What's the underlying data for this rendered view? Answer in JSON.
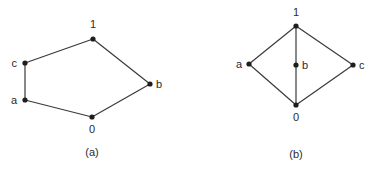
{
  "diagrams": [
    {
      "id": "a",
      "caption": "(a)",
      "caption_pos": [
        92,
        156
      ],
      "nodes": [
        {
          "name": "1",
          "x": 93,
          "y": 39,
          "lx": 93,
          "ly": 28,
          "anchor": "middle"
        },
        {
          "name": "c",
          "x": 25,
          "y": 63,
          "lx": 17,
          "ly": 67,
          "anchor": "end"
        },
        {
          "name": "a",
          "x": 25,
          "y": 100,
          "lx": 17,
          "ly": 104,
          "anchor": "end"
        },
        {
          "name": "0",
          "x": 92,
          "y": 117,
          "lx": 92,
          "ly": 133,
          "anchor": "middle"
        },
        {
          "name": "b",
          "x": 150,
          "y": 84,
          "lx": 156,
          "ly": 88,
          "anchor": "start"
        }
      ],
      "edges": [
        [
          "0",
          "a"
        ],
        [
          "a",
          "c"
        ],
        [
          "c",
          "1"
        ],
        [
          "1",
          "b"
        ],
        [
          "b",
          "0"
        ]
      ]
    },
    {
      "id": "b",
      "caption": "(b)",
      "caption_pos": [
        296,
        158
      ],
      "nodes": [
        {
          "name": "1",
          "x": 296,
          "y": 26,
          "lx": 296,
          "ly": 16,
          "anchor": "middle"
        },
        {
          "name": "a",
          "x": 249,
          "y": 64,
          "lx": 242,
          "ly": 68,
          "anchor": "end"
        },
        {
          "name": "b",
          "x": 296,
          "y": 65,
          "lx": 302,
          "ly": 69,
          "anchor": "start"
        },
        {
          "name": "c",
          "x": 353,
          "y": 65,
          "lx": 359,
          "ly": 69,
          "anchor": "start"
        },
        {
          "name": "0",
          "x": 296,
          "y": 105,
          "lx": 296,
          "ly": 121,
          "anchor": "middle"
        }
      ],
      "edges": [
        [
          "0",
          "a"
        ],
        [
          "a",
          "1"
        ],
        [
          "0",
          "b"
        ],
        [
          "b",
          "1"
        ],
        [
          "0",
          "c"
        ],
        [
          "c",
          "1"
        ]
      ]
    }
  ]
}
